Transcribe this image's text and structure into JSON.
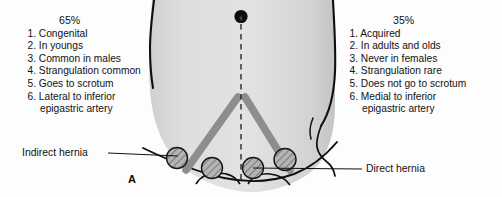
{
  "figure": {
    "panel_letter": "A",
    "width": 502,
    "height": 197
  },
  "indirect_column": {
    "percent": "65%",
    "items": [
      {
        "num": "1.",
        "text": "Congenital"
      },
      {
        "num": "2.",
        "text": "In youngs"
      },
      {
        "num": "3.",
        "text": "Common in males"
      },
      {
        "num": "4.",
        "text": "Strangulation common"
      },
      {
        "num": "5.",
        "text": "Goes to scrotum"
      },
      {
        "num": "6.",
        "text": "Lateral to inferior",
        "cont": "epigastric artery"
      }
    ]
  },
  "direct_column": {
    "percent": "35%",
    "items": [
      {
        "num": "1.",
        "text": "Acquired"
      },
      {
        "num": "2.",
        "text": "In adults and olds"
      },
      {
        "num": "3.",
        "text": "Never  in females"
      },
      {
        "num": "4.",
        "text": "Strangulation rare"
      },
      {
        "num": "5.",
        "text": "Does not go to scrotum"
      },
      {
        "num": "6.",
        "text": "Medial to inferior",
        "cont": "epigastric artery"
      }
    ]
  },
  "callouts": {
    "indirect": "Indirect hernia",
    "direct": "Direct hernia"
  },
  "anatomy": {
    "umbilicus_label": "umbilicus-marker",
    "midline_label": "midline-dashed-line",
    "ligament_label": "inguinal-ligament-band",
    "hernia_sites": [
      {
        "name": "indirect-hernia-site-left",
        "cx": 177,
        "cy": 158,
        "r": 10.5
      },
      {
        "name": "direct-hernia-site-left",
        "cx": 212,
        "cy": 168,
        "r": 10.5
      },
      {
        "name": "direct-hernia-site-right",
        "cx": 253,
        "cy": 168,
        "r": 10.5
      },
      {
        "name": "indirect-hernia-site-right",
        "cx": 285,
        "cy": 160,
        "r": 11
      }
    ]
  },
  "colors": {
    "body_fill": "#d9d9d9",
    "outline": "#111111",
    "ligament": "#8c8c8c",
    "hatch": "#5a5a5a",
    "text": "#121212"
  }
}
